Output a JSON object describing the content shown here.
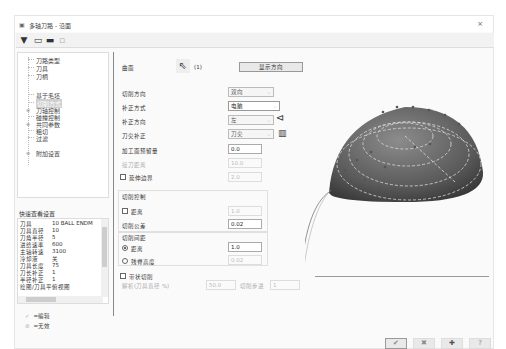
{
  "window": {
    "title": "多轴刀路 - 沿面",
    "close_icon": "×"
  },
  "toolbar": {
    "buttons": [
      {
        "name": "tool-icon",
        "glyph": "▼"
      },
      {
        "name": "save-icon",
        "glyph": "▭"
      },
      {
        "name": "save-as-icon",
        "glyph": "▬"
      },
      {
        "name": "copy-icon",
        "glyph": "▫"
      }
    ]
  },
  "tree": {
    "items": [
      {
        "label": "刀路类型",
        "selected": false
      },
      {
        "label": "刀具",
        "selected": false
      },
      {
        "label": "刀柄",
        "selected": false
      },
      {
        "label": "毛坯",
        "selected": false
      },
      {
        "label": "基于毛坯",
        "selected": false
      },
      {
        "label": "切削方式",
        "selected": true
      },
      {
        "label": "刀轴控制",
        "selected": false,
        "expandable": true
      },
      {
        "label": "碰撞控制",
        "selected": false
      },
      {
        "label": "共同参数",
        "selected": false,
        "expandable": true
      },
      {
        "label": "粗切",
        "selected": false
      },
      {
        "label": "过滤",
        "selected": false
      },
      {
        "label": "附加设置",
        "selected": false,
        "expandable": true
      }
    ]
  },
  "quick_view": {
    "title": "快速查看设置",
    "rows": [
      {
        "key": "刀具",
        "value": "10 BALL ENDM"
      },
      {
        "key": "刀具直径",
        "value": "10"
      },
      {
        "key": "刀角半径",
        "value": "5"
      },
      {
        "key": "进给速率",
        "value": "600"
      },
      {
        "key": "主轴转速",
        "value": "3100"
      },
      {
        "key": "冷却液",
        "value": "关"
      },
      {
        "key": "刀具长度",
        "value": "75"
      },
      {
        "key": "刀长补正",
        "value": "1"
      },
      {
        "key": "半径补正",
        "value": "1"
      },
      {
        "key": "绘图/刀具平",
        "value": "俯视图"
      }
    ],
    "legend": [
      {
        "icon": "check-icon",
        "label": "=编辑"
      },
      {
        "icon": "invalid-icon",
        "label": "=无效"
      }
    ]
  },
  "params": {
    "surface_label": "曲面",
    "surface_count": "(1)",
    "display_direction_button": "显示方向",
    "cut_direction": {
      "label": "切削方向",
      "value": "双向"
    },
    "comp_type": {
      "label": "补正方式",
      "value": "电脑"
    },
    "comp_direction": {
      "label": "补正方向",
      "value": "左"
    },
    "tip_comp": {
      "label": "刀尖补正",
      "value": "刀尖"
    },
    "stock_to_leave": {
      "label": "加工面预留量",
      "value": "0.0"
    },
    "contact_offset": {
      "label": "接刀距离",
      "value": "10.0"
    },
    "extend_edges": {
      "label": "延伸边界",
      "value": "2.0",
      "checked": false
    },
    "cut_control": {
      "title": "切削控制",
      "distance": {
        "label": "距离",
        "value": "1.0",
        "checked": false
      },
      "tolerance": {
        "label": "切削公差",
        "value": "0.02"
      }
    },
    "stepover": {
      "title": "切削间距",
      "distance": {
        "label": "距离",
        "value": "1.0",
        "selected": true
      },
      "scallop": {
        "label": "残脊高度",
        "value": "0.02",
        "selected": false
      }
    },
    "lead": {
      "label": "带状切削",
      "checked": false,
      "ratio_label": "解析(刀具直径 %)",
      "ratio_value": "50.0",
      "step_label": "切削步进",
      "step_value": "1"
    }
  },
  "footer": {
    "ok_icon": "✔",
    "cancel_icon": "✖",
    "apply_icon": "✚",
    "help_icon": "?"
  }
}
